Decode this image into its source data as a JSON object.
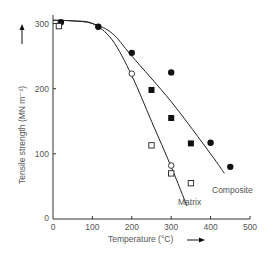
{
  "chart_data": {
    "type": "scatter",
    "title": "",
    "xlabel": "Temperature (°C)",
    "ylabel": "Tensile strength (MN m⁻²)",
    "xlim": [
      0,
      500
    ],
    "ylim": [
      0,
      310
    ],
    "x_ticks": [
      0,
      100,
      200,
      300,
      400,
      500
    ],
    "y_ticks": [
      0,
      100,
      200,
      300
    ],
    "grid": false,
    "legend": "none (curves labeled directly)",
    "series": [
      {
        "name": "Composite (filled circles)",
        "marker": "filled-circle",
        "points": [
          [
            20,
            302
          ],
          [
            115,
            295
          ],
          [
            200,
            255
          ],
          [
            300,
            225
          ],
          [
            400,
            117
          ],
          [
            450,
            80
          ]
        ]
      },
      {
        "name": "Composite (filled squares)",
        "marker": "filled-square",
        "points": [
          [
            250,
            198
          ],
          [
            300,
            155
          ],
          [
            350,
            116
          ]
        ]
      },
      {
        "name": "Matrix (open squares)",
        "marker": "open-square",
        "points": [
          [
            15,
            296
          ],
          [
            250,
            113
          ],
          [
            300,
            70
          ],
          [
            350,
            55
          ]
        ]
      },
      {
        "name": "Matrix (open circles)",
        "marker": "open-circle",
        "points": [
          [
            200,
            223
          ],
          [
            300,
            82
          ]
        ]
      }
    ],
    "curves": [
      {
        "name": "Composite",
        "points": [
          [
            0,
            305
          ],
          [
            50,
            304
          ],
          [
            100,
            300
          ],
          [
            150,
            285
          ],
          [
            200,
            250
          ],
          [
            300,
            180
          ],
          [
            400,
            100
          ],
          [
            435,
            70
          ]
        ]
      },
      {
        "name": "Matrix",
        "points": [
          [
            0,
            305
          ],
          [
            50,
            304
          ],
          [
            100,
            300
          ],
          [
            150,
            275
          ],
          [
            200,
            220
          ],
          [
            250,
            150
          ],
          [
            300,
            80
          ],
          [
            340,
            20
          ]
        ]
      }
    ],
    "annotations": [
      "Composite",
      "Matrix"
    ]
  },
  "axes": {
    "xlabel": "Temperature (°C)",
    "ylabel": "Tensile strength (MN m⁻²)",
    "x_ticks": [
      "0",
      "100",
      "200",
      "300",
      "400",
      "500"
    ],
    "y_ticks": [
      "0",
      "100",
      "200",
      "300"
    ],
    "origin_label": "0"
  },
  "labels": {
    "composite": "Composite",
    "matrix": "Matrix"
  }
}
